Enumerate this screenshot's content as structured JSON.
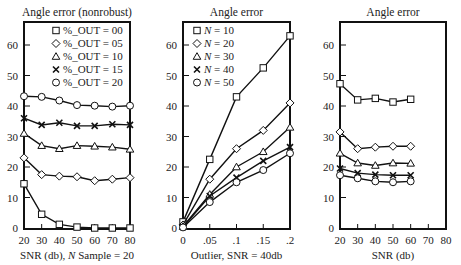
{
  "chart_data": [
    {
      "type": "line",
      "title": "Angle error (nonrobust)",
      "xlabel": "SNR (db), N Sample = 20",
      "xlabel_parts": [
        "SNR (db), ",
        "N",
        " Sample = 20"
      ],
      "ylabel": "",
      "xlim": [
        20,
        80
      ],
      "ylim": [
        0,
        68
      ],
      "x": [
        20,
        30,
        40,
        50,
        60,
        70,
        80
      ],
      "xticks": [
        "20",
        "30",
        "40",
        "50",
        "60",
        "70",
        "80"
      ],
      "yticks": [
        "0",
        "10",
        "20",
        "30",
        "40",
        "50",
        "60"
      ],
      "legend_position": "upper right (inside)",
      "series": [
        {
          "name": "%_OUT = 00",
          "marker": "square",
          "values": [
            14.5,
            4.5,
            1.2,
            0.3,
            0,
            0,
            0
          ]
        },
        {
          "name": "%_OUT = 05",
          "marker": "diamond",
          "values": [
            23,
            17.5,
            17,
            16.8,
            15.5,
            16,
            16.5
          ]
        },
        {
          "name": "%_OUT = 10",
          "marker": "triangle",
          "values": [
            31,
            27,
            26,
            27,
            26.8,
            26.5,
            25.8
          ]
        },
        {
          "name": "%_OUT = 15",
          "marker": "x",
          "values": [
            36,
            33.8,
            34.5,
            33.5,
            33.5,
            34,
            33.8
          ]
        },
        {
          "name": "%_OUT = 20",
          "marker": "circle",
          "values": [
            43.2,
            43,
            41.8,
            40.3,
            40.1,
            39.8,
            40.1
          ]
        }
      ]
    },
    {
      "type": "line",
      "title": "Angle error",
      "xlabel": "Outlier, SNR = 40db",
      "ylabel": "",
      "xlim": [
        0,
        0.2
      ],
      "ylim": [
        0,
        68
      ],
      "x": [
        0,
        0.05,
        0.1,
        0.15,
        0.2
      ],
      "xticks": [
        "0",
        ".05",
        ".1",
        ".15",
        ".2"
      ],
      "yticks": [
        "0",
        "10",
        "20",
        "30",
        "40",
        "50",
        "60"
      ],
      "legend_position": "upper left (inside)",
      "series": [
        {
          "name": "N = 10",
          "marker": "square",
          "values": [
            2,
            22.5,
            43,
            52.5,
            63
          ]
        },
        {
          "name": "N = 20",
          "marker": "diamond",
          "values": [
            1,
            16,
            26,
            32,
            41
          ]
        },
        {
          "name": "N = 30",
          "marker": "triangle",
          "values": [
            0.5,
            11,
            20,
            25,
            33
          ]
        },
        {
          "name": "N = 40",
          "marker": "x",
          "values": [
            0.3,
            10.5,
            16.5,
            22,
            26.5
          ]
        },
        {
          "name": "N = 50",
          "marker": "circle",
          "values": [
            0.2,
            8.5,
            15,
            19,
            24.5
          ]
        }
      ]
    },
    {
      "type": "line",
      "title": "Angle error",
      "xlabel": "SNR (db)",
      "ylabel": "",
      "xlim": [
        20,
        80
      ],
      "ylim": [
        0,
        68
      ],
      "x": [
        20,
        30,
        40,
        50,
        60
      ],
      "xticks": [
        "20",
        "30",
        "40",
        "50",
        "60",
        "70",
        "80"
      ],
      "yticks": [
        "0",
        "10",
        "20",
        "30",
        "40",
        "50",
        "60"
      ],
      "legend_position": "none",
      "series": [
        {
          "name": "N = 10",
          "marker": "square",
          "values": [
            47.3,
            42,
            42.5,
            41.3,
            42.2
          ]
        },
        {
          "name": "N = 20",
          "marker": "diamond",
          "values": [
            31.5,
            26,
            26.5,
            26.8,
            26.8
          ]
        },
        {
          "name": "N = 30",
          "marker": "triangle",
          "values": [
            24.5,
            21.3,
            20.5,
            21.3,
            21.2
          ]
        },
        {
          "name": "N = 40",
          "marker": "x",
          "values": [
            19.5,
            18,
            17.5,
            17.3,
            17.3
          ]
        },
        {
          "name": "N = 50",
          "marker": "circle",
          "values": [
            17.3,
            16.3,
            15.3,
            15,
            15.3
          ]
        }
      ]
    }
  ]
}
